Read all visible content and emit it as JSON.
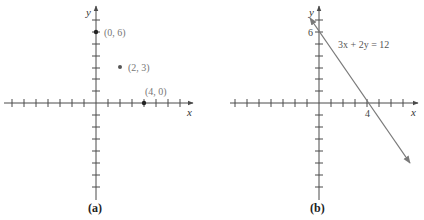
{
  "panel_a": {
    "caption": "(a)",
    "x_axis_label": "x",
    "y_axis_label": "y",
    "points": [
      {
        "label": "(0, 6)",
        "x": 0,
        "y": 6
      },
      {
        "label": "(2, 3)",
        "x": 2,
        "y": 3
      },
      {
        "label": "(4, 0)",
        "x": 4,
        "y": 0
      }
    ]
  },
  "panel_b": {
    "caption": "(b)",
    "x_axis_label": "x",
    "y_axis_label": "y",
    "equation": "3x + 2y = 12",
    "y_intercept_label": "6",
    "x_intercept_label": "4"
  },
  "colors": {
    "axis": "#4a4a4a",
    "line": "#7a7a7a",
    "label": "#777777"
  }
}
